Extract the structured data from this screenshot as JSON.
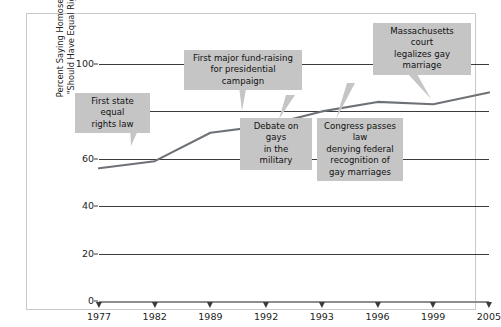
{
  "chart_data": {
    "type": "line",
    "title": "",
    "subtitle": "",
    "xlabel": "",
    "ylabel": "Percent Saying Homosexuals \"Should Have Equal Rights\"",
    "ylabel_lines": [
      "Percent Saying Homosexuals",
      "\"Should Have Equal Rights\""
    ],
    "categories": [
      "1977",
      "1982",
      "1989",
      "1992",
      "1993",
      "1996",
      "1999",
      "2005"
    ],
    "values": [
      56,
      59,
      71,
      74,
      80,
      84,
      83,
      88
    ],
    "series": [
      {
        "name": "Percent saying homosexuals should have equal rights",
        "values": [
          56,
          59,
          71,
          74,
          80,
          84,
          83,
          88
        ]
      }
    ],
    "ylim": [
      0,
      100
    ],
    "yticks": [
      0,
      20,
      40,
      60,
      80,
      100
    ],
    "ytick_labels": [
      "0",
      "20",
      "40",
      "60",
      "80",
      "100"
    ],
    "grid": true,
    "grid_axis": "y",
    "legend": false,
    "legend_position": "none",
    "line_color": "#6e7277",
    "annotation_bg_color": "#c5c5c5",
    "annotations": [
      {
        "id": "first-state-equal-rights-law",
        "text": "First state equal\nrights law",
        "target_category": "1982",
        "target_value": 59
      },
      {
        "id": "first-major-fund-raising",
        "text": "First major fund-raising\nfor presidential campaign",
        "target_category": "1992",
        "target_value": 74
      },
      {
        "id": "debate-on-gays-in-the-military",
        "text": "Debate on gays\nin the military",
        "target_category": "1993",
        "target_value": 80
      },
      {
        "id": "congress-passes-law",
        "text": "Congress passes law\ndenying federal\nrecognition of\ngay marriages",
        "target_category": "1996",
        "target_value": 84
      },
      {
        "id": "massachusetts-court",
        "text": "Massachusetts court\nlegalizes gay\nmarriage",
        "target_category": "2005",
        "target_value": 88
      }
    ]
  },
  "axis": {
    "y_tick_0": "0",
    "y_tick_20": "20",
    "y_tick_40": "40",
    "y_tick_60": "60",
    "y_tick_80": "80",
    "y_tick_100": "100",
    "x_tick_1977": "1977",
    "x_tick_1982": "1982",
    "x_tick_1989": "1989",
    "x_tick_1992": "1992",
    "x_tick_1993": "1993",
    "x_tick_1996": "1996",
    "x_tick_1999": "1999",
    "x_tick_2005": "2005"
  },
  "ylabel": {
    "line1": "Percent Saying Homosexuals",
    "line2": "\"Should Have Equal Rights\""
  },
  "callouts": {
    "a": "First state equal\nrights law",
    "b": "First major fund-raising\nfor presidential campaign",
    "c": "Debate on gays\nin the military",
    "d": "Congress passes law\ndenying federal\nrecognition of\ngay marriages",
    "e": "Massachusetts court\nlegalizes gay\nmarriage"
  }
}
